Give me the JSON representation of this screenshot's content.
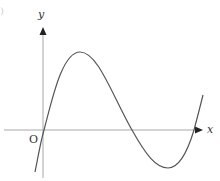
{
  "figure": {
    "corner_mark": ")",
    "axes": {
      "x_label": "x",
      "y_label": "y",
      "origin_label": "O"
    },
    "colors": {
      "axis": "#9a9a9a",
      "curve": "#555555",
      "arrow": "#222222",
      "text": "#333333"
    },
    "curve": {
      "description": "Cubic-shaped curve passing through the origin, with a local maximum above the positive x-axis, crossing the x-axis twice more on the positive side, with a local minimum below the x-axis between those crossings",
      "points_px": [
        [
          35,
          172
        ],
        [
          44,
          130
        ],
        [
          80,
          52
        ],
        [
          132,
          130
        ],
        [
          168,
          168
        ],
        [
          194,
          130
        ],
        [
          203,
          95
        ]
      ]
    }
  }
}
